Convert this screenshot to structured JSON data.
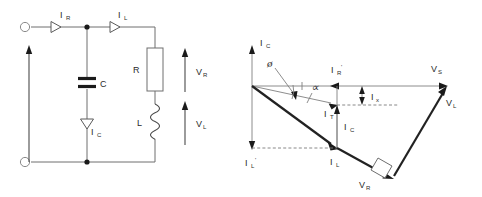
{
  "figure": {
    "colors": {
      "background": "#ffffff",
      "wire": "#6e6e6e",
      "phasor_bold": "#222222",
      "dashed": "#7a7a7a",
      "text": "#2b2b2b"
    }
  },
  "circuit": {
    "name": "parallel-RL-C-circuit",
    "labels": {
      "current_source_branch": "I",
      "current_source_branch_sub": "R",
      "inductive_branch": "I",
      "inductive_branch_sub": "L",
      "capacitor_current": "I",
      "capacitor_current_sub": "C",
      "capacitor": "C",
      "resistor": "R",
      "inductor": "L",
      "resistor_voltage": "V",
      "resistor_voltage_sub": "R",
      "inductor_voltage": "V",
      "inductor_voltage_sub": "L"
    },
    "components": [
      {
        "name": "capacitor",
        "label": "C",
        "type": "capacitor"
      },
      {
        "name": "resistor",
        "label": "R",
        "type": "resistor"
      },
      {
        "name": "inductor",
        "label": "L",
        "type": "inductor"
      }
    ],
    "terminals": [
      {
        "name": "input-terminal-top",
        "position": "top-left"
      },
      {
        "name": "input-terminal-bottom",
        "position": "bottom-left"
      }
    ]
  },
  "phasor": {
    "name": "phasor-diagram",
    "labels": {
      "vertical_axis": "I",
      "vertical_axis_sub": "C",
      "phi": "ø",
      "alpha": "∝",
      "i_r_prime": "I",
      "i_r_prime_sub": "R",
      "i_r_prime_mark": "'",
      "i_t": "I",
      "i_t_sub": "T",
      "i_x": "I",
      "i_x_sub": "x",
      "i_c": "I",
      "i_c_sub": "C",
      "i_l": "I",
      "i_l_sub": "L",
      "i_l_prime": "I",
      "i_l_prime_sub": "L",
      "i_l_prime_mark": "'",
      "v_s": "V",
      "v_s_sub": "S",
      "v_l": "V",
      "v_l_sub": "L",
      "v_r": "V",
      "v_r_sub": "R"
    },
    "vectors": [
      {
        "name": "i-c-axis",
        "label": "IC",
        "direction": "up",
        "style": "thin"
      },
      {
        "name": "i-r-prime",
        "label": "IR'",
        "direction": "left",
        "style": "thin"
      },
      {
        "name": "i-t",
        "label": "IT",
        "direction": "down-right",
        "style": "thin"
      },
      {
        "name": "i-l",
        "label": "IL",
        "direction": "down-right",
        "style": "bold"
      },
      {
        "name": "i-l-prime",
        "label": "IL'",
        "direction": "down",
        "style": "thin"
      },
      {
        "name": "i-x",
        "label": "Ix",
        "direction": "vertical-span",
        "style": "thin"
      },
      {
        "name": "v-s",
        "label": "VS",
        "direction": "right",
        "style": "thin"
      },
      {
        "name": "v-l",
        "label": "VL",
        "direction": "up-right",
        "style": "bold"
      },
      {
        "name": "v-r",
        "label": "VR",
        "direction": "down-right",
        "style": "bold"
      }
    ],
    "annotations": [
      {
        "name": "right-angle-marker",
        "label": "90"
      }
    ]
  }
}
